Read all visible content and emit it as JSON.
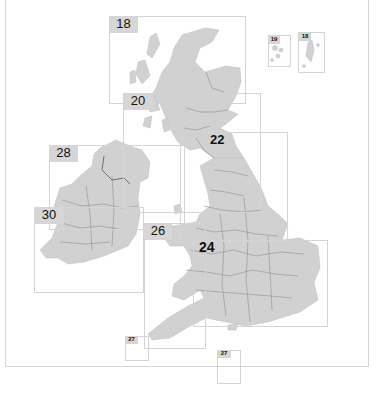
{
  "map": {
    "title": "Key map: Great Britain and Ireland",
    "land_color": "#d1d1d1",
    "border_color": "#8a8a8a",
    "sea_color": "#ffffff",
    "frame_color": "#d6d6d6",
    "pages": [
      {
        "id": "p18",
        "label": "18",
        "region": "Northern Scotland"
      },
      {
        "id": "p20",
        "label": "20",
        "region": "Southern Scotland"
      },
      {
        "id": "p22",
        "label": "22",
        "region": "Northern England"
      },
      {
        "id": "p28",
        "label": "28",
        "region": "Northern Ireland"
      },
      {
        "id": "p30",
        "label": "30",
        "region": "Ireland"
      },
      {
        "id": "p26",
        "label": "26",
        "region": "Wales & South West"
      },
      {
        "id": "p24",
        "label": "24",
        "region": "Central & Southern England"
      },
      {
        "id": "p19",
        "label": "19",
        "region": "Orkney"
      },
      {
        "id": "p18b",
        "label": "18",
        "region": "Shetland"
      },
      {
        "id": "p27a",
        "label": "27",
        "region": "Isles of Scilly"
      },
      {
        "id": "p27b",
        "label": "27",
        "region": "Channel Islands"
      }
    ]
  }
}
